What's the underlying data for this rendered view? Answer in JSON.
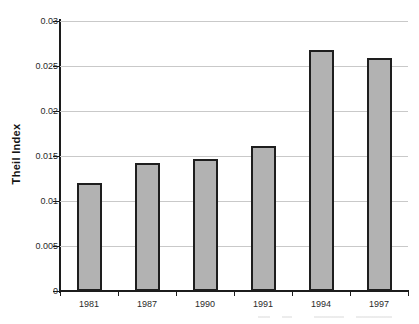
{
  "chart_data": {
    "type": "bar",
    "title": "",
    "xlabel": "",
    "ylabel": "Theil Index",
    "categories": [
      "1981",
      "1987",
      "1990",
      "1991",
      "1994",
      "1997"
    ],
    "values": [
      0.012,
      0.0142,
      0.0147,
      0.0161,
      0.0268,
      0.0259
    ],
    "series": [
      {
        "name": "Theil Index",
        "values": [
          0.012,
          0.0142,
          0.0147,
          0.0161,
          0.0268,
          0.0259
        ]
      }
    ],
    "ylim": [
      0,
      0.03
    ],
    "ytick_values": [
      0,
      0.005,
      0.01,
      0.015,
      0.02,
      0.025,
      0.03
    ],
    "ytick_labels": [
      "0",
      "0.005",
      "0.01",
      "0.015",
      "0.02",
      "0.025",
      "0.03"
    ],
    "grid": true,
    "grid_axis": "y",
    "legend": false,
    "legend_position": "none",
    "bar_color": "#b2b2b2",
    "bar_border_color": "#1e1e1e",
    "gridline_color": "#c9c9c9",
    "axis_color": "#1c1c1c",
    "background_color": "#ffffff"
  }
}
